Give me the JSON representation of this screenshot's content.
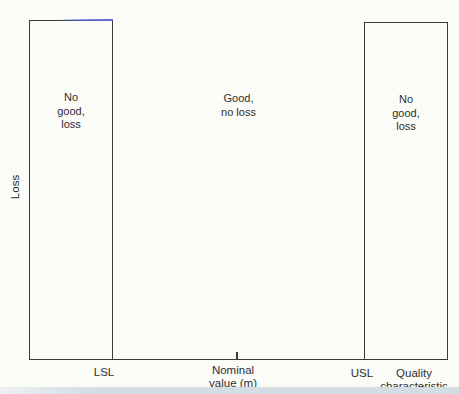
{
  "y_axis_label": "Loss",
  "regions": [
    {
      "id": "below-lsl",
      "lines": [
        "No",
        "good,",
        "loss"
      ]
    },
    {
      "id": "within-spec",
      "lines": [
        "Good,",
        "no loss"
      ]
    },
    {
      "id": "above-usl",
      "lines": [
        "No",
        "good,",
        "loss"
      ]
    }
  ],
  "x_axis": {
    "lsl": "LSL",
    "nominal": [
      "Nominal",
      "value (m)"
    ],
    "usl": "USL",
    "title": [
      "Quality",
      "characteristic"
    ]
  },
  "colors": {
    "line": "#3b3b3b",
    "text": "#2f2f2f",
    "background": "#fbfbf8",
    "scan_artifact_blue": "#5c6ad8",
    "bottom_band": "#d3dde4"
  }
}
